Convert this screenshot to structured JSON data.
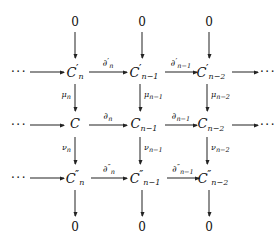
{
  "diagram": {
    "kind": "commutative-diagram",
    "caption": "Short exact sequence of chain complexes",
    "ink_color": "#222222",
    "background_color": "#ffffff",
    "zero": "0",
    "ellipsis": "···",
    "objects": {
      "top_zero_1": "0",
      "top_zero_2": "0",
      "top_zero_3": "0",
      "r1_lead_dots": "···",
      "r1_c1_base": "C",
      "r1_c1_prime": "′",
      "r1_c1_sub": "n",
      "r1_c2_base": "C",
      "r1_c2_prime": "′",
      "r1_c2_sub": "n−1",
      "r1_c3_base": "C",
      "r1_c3_prime": "′",
      "r1_c3_sub": "n−2",
      "r1_trail_dots": "···",
      "r2_lead_dots": "···",
      "r2_c1_base": "C",
      "r2_c1_sub": "",
      "r2_c2_base": "C",
      "r2_c2_sub": "n−1",
      "r2_c3_base": "C",
      "r2_c3_sub": "n−2",
      "r2_trail_dots": "···",
      "r3_lead_dots": "···",
      "r3_c1_base": "C",
      "r3_c1_prime": "″",
      "r3_c1_sub": "n",
      "r3_c2_base": "C",
      "r3_c2_prime": "″",
      "r3_c2_sub": "n−1",
      "r3_c3_base": "C",
      "r3_c3_prime": "″",
      "r3_c3_sub": "n−2",
      "bottom_zero_1": "0",
      "bottom_zero_2": "0",
      "bottom_zero_3": "0"
    },
    "horizontal_maps": {
      "r1_m1_base": "∂",
      "r1_m1_prime": "′",
      "r1_m1_sub": "n",
      "r1_m2_base": "∂",
      "r1_m2_prime": "′",
      "r1_m2_sub": "n−1",
      "r2_m1_base": "∂",
      "r2_m1_sub": "n",
      "r2_m2_base": "∂",
      "r2_m2_sub": "n−1",
      "r3_m1_base": "∂",
      "r3_m1_prime": "″",
      "r3_m1_sub": "n",
      "r3_m2_base": "∂",
      "r3_m2_prime": "″",
      "r3_m2_sub": "n−1"
    },
    "vertical_maps": {
      "mu1_base": "μ",
      "mu1_sub": "n",
      "mu2_base": "μ",
      "mu2_sub": "n−1",
      "mu3_base": "μ",
      "mu3_sub": "n−2",
      "nu1_base": "ν",
      "nu1_sub": "n",
      "nu2_base": "ν",
      "nu2_sub": "n−1",
      "nu3_base": "ν",
      "nu3_sub": "n−2"
    }
  }
}
